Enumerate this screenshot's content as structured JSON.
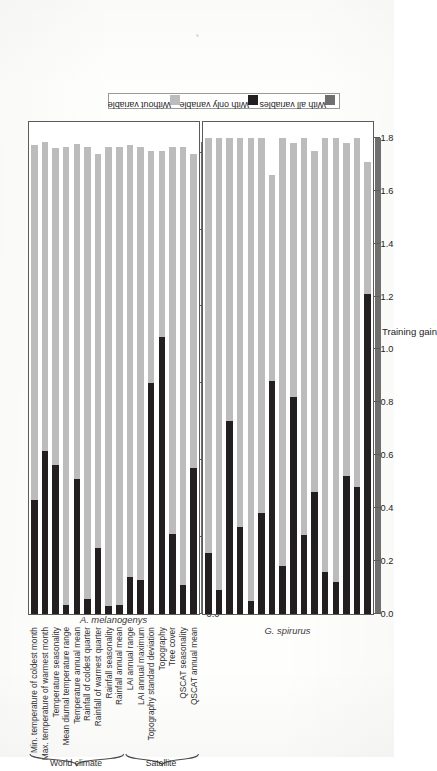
{
  "figure": {
    "orientation": "rotated-90-ccw",
    "axis_title": "Training gain",
    "group_labels": [
      "World climate",
      "Satellite"
    ],
    "colors": {
      "without_variable": "#bcbcbc",
      "with_only_variable": "#231f20",
      "with_all_variables": "#6f6f6f",
      "frame": "#5b5b5b"
    }
  },
  "legend": {
    "items": [
      {
        "label": "Without variable",
        "color": "#bcbcbc"
      },
      {
        "label": "With only variable",
        "color": "#231f20"
      },
      {
        "label": "With all variables",
        "color": "#6f6f6f"
      }
    ]
  },
  "variables": [
    "Min. temperature of coldest month",
    "Max. temperature of warmest month",
    "Temperature seasonality",
    "Mean diurnal temperature range",
    "Temperature annual mean",
    "Rainfall of coldest quarter",
    "Rainfall of warmest quarter",
    "Rainfall seasonality",
    "Rainfall annual mean",
    "LAI annual range",
    "LAI annual maximum",
    "Topography standard deviation",
    "Topography",
    "Tree cover",
    "QSCAT seasonality",
    "QSCAT annual mean"
  ],
  "groups": [
    {
      "label": "World climate",
      "from": 0,
      "to": 8
    },
    {
      "label": "Satellite",
      "from": 9,
      "to": 15
    }
  ],
  "chart_data": {
    "type": "bar",
    "title": "",
    "xlabel": "Training gain",
    "ylabel": "",
    "grid": false,
    "legend_position": "right",
    "panels": [
      {
        "name": "A. melanogenys",
        "xlim": [
          0.0,
          3.2
        ],
        "ticks": [
          0.0,
          0.5,
          1.0,
          1.5,
          2.0,
          2.5,
          3.0
        ],
        "tick_labels": [
          "0.0",
          "0.5",
          "1.0",
          "1.5",
          "2.0",
          "2.5",
          "3.0"
        ],
        "categories": [
          "Min. temperature of coldest month",
          "Max. temperature of warmest month",
          "Temperature seasonality",
          "Mean diurnal temperature range",
          "Temperature annual mean",
          "Rainfall of coldest quarter",
          "Rainfall of warmest quarter",
          "Rainfall seasonality",
          "Rainfall annual mean",
          "LAI annual range",
          "LAI annual maximum",
          "Topography standard deviation",
          "Topography",
          "Tree cover",
          "QSCAT seasonality",
          "QSCAT annual mean"
        ],
        "series": [
          {
            "name": "Without variable",
            "values": [
              3.05,
              3.07,
              3.03,
              3.04,
              3.06,
              3.04,
              2.99,
              3.04,
              3.04,
              3.05,
              3.04,
              3.01,
              3.01,
              3.04,
              3.04,
              2.99
            ]
          },
          {
            "name": "With only variable",
            "values": [
              0.74,
              1.06,
              0.97,
              0.06,
              0.88,
              0.1,
              0.43,
              0.05,
              0.06,
              0.24,
              0.22,
              1.5,
              1.8,
              0.52,
              0.19,
              0.95
            ]
          }
        ],
        "with_all_variables": 3.07
      },
      {
        "name": "G. spirurus",
        "xlim": [
          0.0,
          1.86
        ],
        "ticks": [
          0.0,
          0.2,
          0.4,
          0.6,
          0.8,
          1.0,
          1.2,
          1.4,
          1.6,
          1.8
        ],
        "tick_labels": [
          "0.0",
          "0.2",
          "0.4",
          "0.6",
          "0.8",
          "1.0",
          "1.2",
          "1.4",
          "1.6",
          "1.8"
        ],
        "categories": [
          "Min. temperature of coldest month",
          "Max. temperature of warmest month",
          "Temperature seasonality",
          "Mean diurnal temperature range",
          "Temperature annual mean",
          "Rainfall of coldest quarter",
          "Rainfall of warmest quarter",
          "Rainfall seasonality",
          "Rainfall annual mean",
          "LAI annual range",
          "LAI annual maximum",
          "Topography standard deviation",
          "Topography",
          "Tree cover",
          "QSCAT seasonality",
          "QSCAT annual mean"
        ],
        "series": [
          {
            "name": "Without variable",
            "values": [
              1.8,
              1.8,
              1.8,
              1.8,
              1.8,
              1.8,
              1.66,
              1.8,
              1.78,
              1.8,
              1.75,
              1.8,
              1.8,
              1.78,
              1.8,
              1.71
            ]
          },
          {
            "name": "With only variable",
            "values": [
              0.23,
              0.09,
              0.73,
              0.33,
              0.05,
              0.38,
              0.88,
              0.18,
              0.82,
              0.3,
              0.46,
              0.16,
              0.12,
              0.52,
              0.48,
              1.21
            ]
          }
        ],
        "with_all_variables": 1.8
      }
    ]
  }
}
